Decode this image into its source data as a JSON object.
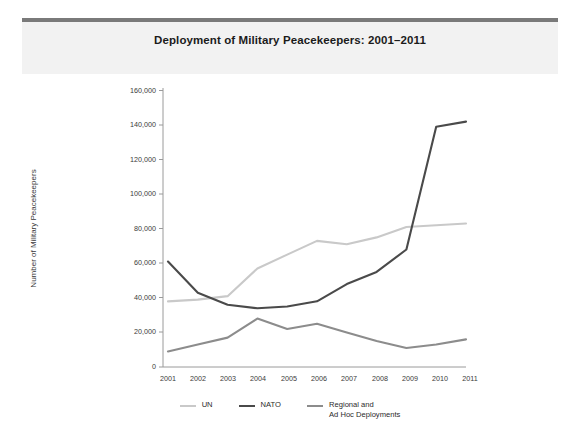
{
  "header": {
    "title": "Deployment of Military Peacekeepers: 2001–2011"
  },
  "axes": {
    "ylabel": "Number of Military Peacekeepers",
    "xlabel": "",
    "ytick_labels": [
      "160,000",
      "140,000",
      "120,000",
      "100,000",
      "80,000",
      "60,000",
      "40,000",
      "20,000",
      "0"
    ],
    "xtick_labels": [
      "2001",
      "2002",
      "2003",
      "2004",
      "2005",
      "2006",
      "2007",
      "2008",
      "2009",
      "2010",
      "2011"
    ]
  },
  "legend": {
    "position": "bottom-center",
    "items": [
      {
        "label": "UN",
        "color": "#c9c9c9"
      },
      {
        "label": "NATO",
        "color": "#4a4a4a"
      },
      {
        "label": "Regional and\nAd Hoc Deployments",
        "color": "#8c8c8c"
      }
    ]
  },
  "colors": {
    "un": "#c9c9c9",
    "nato": "#4a4a4a",
    "regional": "#8c8c8c",
    "axis": "#9a9a9a",
    "title_rule": "#7a7a7a",
    "header_band": "#f2f2f2",
    "text": "#3a3a3a",
    "background": "#ffffff"
  },
  "chart_data": {
    "type": "line",
    "title": "Deployment of Military Peacekeepers: 2001–2011",
    "xlabel": "",
    "ylabel": "Number of Military Peacekeepers",
    "x": [
      2001,
      2002,
      2003,
      2004,
      2005,
      2006,
      2007,
      2008,
      2009,
      2010,
      2011
    ],
    "categories": [
      "2001",
      "2002",
      "2003",
      "2004",
      "2005",
      "2006",
      "2007",
      "2008",
      "2009",
      "2010",
      "2011"
    ],
    "xlim": [
      2001,
      2011
    ],
    "ylim": [
      0,
      160000
    ],
    "yticks": [
      0,
      20000,
      40000,
      60000,
      80000,
      100000,
      120000,
      140000,
      160000
    ],
    "grid": false,
    "legend_position": "bottom-center",
    "series": [
      {
        "name": "UN",
        "color": "#c9c9c9",
        "values": [
          38000,
          39000,
          41000,
          57000,
          65000,
          73000,
          71000,
          75000,
          81000,
          82000,
          83000
        ]
      },
      {
        "name": "NATO",
        "color": "#4a4a4a",
        "values": [
          61000,
          43000,
          36000,
          34000,
          35000,
          38000,
          48000,
          55000,
          68000,
          139000,
          142000
        ]
      },
      {
        "name": "Regional and Ad Hoc Deployments",
        "color": "#8c8c8c",
        "values": [
          9000,
          13000,
          17000,
          28000,
          22000,
          25000,
          20000,
          15000,
          11000,
          13000,
          16000
        ]
      }
    ]
  }
}
